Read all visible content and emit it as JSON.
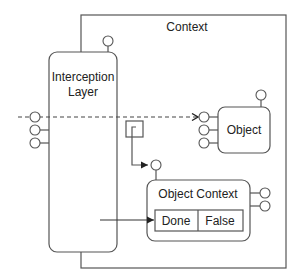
{
  "diagram": {
    "context": {
      "label": "Context"
    },
    "interception_layer": {
      "label_line1": "Interception",
      "label_line2": "Layer"
    },
    "object": {
      "label": "Object"
    },
    "object_context": {
      "label": "Object Context",
      "fields": [
        "Done",
        "False"
      ]
    },
    "colors": {
      "stroke": "#555555",
      "text": "#222222",
      "background": "#ffffff"
    }
  }
}
